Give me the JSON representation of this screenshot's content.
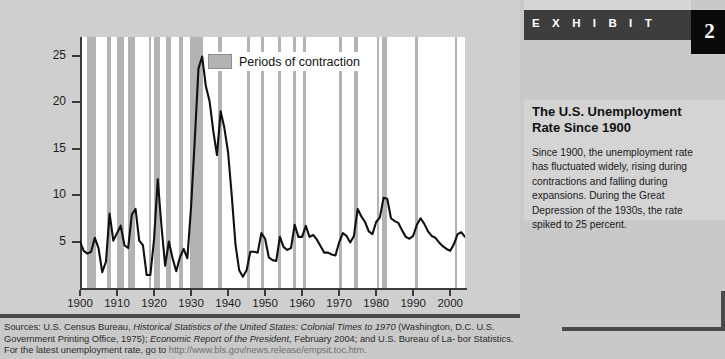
{
  "exhibit": {
    "header_label": "E X H I B I T",
    "number": "2",
    "title": "The U.S. Unemployment Rate Since 1900",
    "body": "Since 1900, the unemployment rate has fluctuated widely, rising during contractions and falling during expansions. During the Great Depression of the 1930s, the rate spiked to 25 percent.",
    "colors": {
      "header_bar": "#3d3d3d",
      "number_box": "#0a0a0a",
      "panel_bg": "#c9c9c9",
      "body_bg": "#d4d4d4",
      "edge_rule": "#4a4a4a"
    }
  },
  "sources": {
    "line1_prefix": "Sources: U.S. Census Bureau, ",
    "line1_italic": "Historical Statistics of the United States: Colonial Times to 1970",
    "line1_suffix": " (Washington, D.C.",
    "line2_prefix": "U.S. Government Printing Office, 1975); ",
    "line2_italic": "Economic Report of the President",
    "line2_suffix": ", February 2004; and U.S. Bureau of La-",
    "line3_prefix": "bor Statistics. For the latest unemployment rate, go to ",
    "line3_url": "http://www.bls.gov/news.release/empsit.toc.htm."
  },
  "chart_data": {
    "type": "line",
    "title": "The U.S. Unemployment Rate Since 1900",
    "xlabel": "",
    "ylabel": "",
    "xlim": [
      1900,
      2004
    ],
    "ylim": [
      0,
      27
    ],
    "grid": false,
    "legend_position": "top-center",
    "legend": [
      {
        "label": "Periods of contraction",
        "color": "#b3b3b3",
        "type": "band"
      }
    ],
    "ytick_labels": [
      "5",
      "10",
      "15",
      "20",
      "25"
    ],
    "ytick_values": [
      5,
      10,
      15,
      20,
      25
    ],
    "xtick_labels": [
      "1900",
      "1910",
      "1920",
      "1930",
      "1940",
      "1950",
      "1960",
      "1970",
      "1980",
      "1990",
      "2000"
    ],
    "xtick_values": [
      1900,
      1910,
      1920,
      1930,
      1940,
      1950,
      1960,
      1970,
      1980,
      1990,
      2000
    ],
    "series": [
      {
        "name": "U.S. unemployment rate (percent)",
        "color": "#111111",
        "x": [
          1900,
          1901,
          1902,
          1903,
          1904,
          1905,
          1906,
          1907,
          1908,
          1909,
          1910,
          1911,
          1912,
          1913,
          1914,
          1915,
          1916,
          1917,
          1918,
          1919,
          1920,
          1921,
          1922,
          1923,
          1924,
          1925,
          1926,
          1927,
          1928,
          1929,
          1930,
          1931,
          1932,
          1933,
          1934,
          1935,
          1936,
          1937,
          1938,
          1939,
          1940,
          1941,
          1942,
          1943,
          1944,
          1945,
          1946,
          1947,
          1948,
          1949,
          1950,
          1951,
          1952,
          1953,
          1954,
          1955,
          1956,
          1957,
          1958,
          1959,
          1960,
          1961,
          1962,
          1963,
          1964,
          1965,
          1966,
          1967,
          1968,
          1969,
          1970,
          1971,
          1972,
          1973,
          1974,
          1975,
          1976,
          1977,
          1978,
          1979,
          1980,
          1981,
          1982,
          1983,
          1984,
          1985,
          1986,
          1987,
          1988,
          1989,
          1990,
          1991,
          1992,
          1993,
          1994,
          1995,
          1996,
          1997,
          1998,
          1999,
          2000,
          2001,
          2002,
          2003,
          2004
        ],
        "values": [
          5.0,
          4.0,
          3.7,
          3.9,
          5.4,
          4.3,
          1.7,
          2.8,
          8.0,
          5.1,
          5.9,
          6.7,
          4.6,
          4.3,
          7.9,
          8.5,
          5.1,
          4.6,
          1.4,
          1.4,
          5.2,
          11.7,
          6.7,
          2.4,
          5.0,
          3.2,
          1.8,
          3.3,
          4.2,
          3.2,
          8.7,
          15.9,
          23.6,
          24.9,
          21.7,
          20.1,
          16.9,
          14.3,
          19.0,
          17.2,
          14.6,
          9.9,
          4.7,
          1.9,
          1.2,
          1.9,
          3.9,
          3.9,
          3.8,
          5.9,
          5.3,
          3.3,
          3.0,
          2.9,
          5.5,
          4.4,
          4.1,
          4.3,
          6.8,
          5.5,
          5.5,
          6.7,
          5.5,
          5.7,
          5.2,
          4.5,
          3.8,
          3.8,
          3.6,
          3.5,
          4.9,
          5.9,
          5.6,
          4.9,
          5.6,
          8.5,
          7.7,
          7.1,
          6.1,
          5.8,
          7.1,
          7.6,
          9.7,
          9.6,
          7.5,
          7.2,
          7.0,
          6.2,
          5.5,
          5.3,
          5.6,
          6.8,
          7.5,
          6.9,
          6.1,
          5.6,
          5.4,
          4.9,
          4.5,
          4.2,
          4.0,
          4.7,
          5.8,
          6.0,
          5.5
        ]
      }
    ],
    "contraction_bands": [
      {
        "start": 1902.0,
        "end": 1904.3
      },
      {
        "start": 1907.3,
        "end": 1908.5
      },
      {
        "start": 1910.1,
        "end": 1912.0
      },
      {
        "start": 1913.1,
        "end": 1914.9
      },
      {
        "start": 1918.6,
        "end": 1919.2
      },
      {
        "start": 1920.1,
        "end": 1921.5
      },
      {
        "start": 1923.3,
        "end": 1924.5
      },
      {
        "start": 1926.7,
        "end": 1927.8
      },
      {
        "start": 1929.6,
        "end": 1933.2
      },
      {
        "start": 1937.4,
        "end": 1938.4
      },
      {
        "start": 1945.1,
        "end": 1945.8
      },
      {
        "start": 1948.8,
        "end": 1949.8
      },
      {
        "start": 1953.5,
        "end": 1954.4
      },
      {
        "start": 1957.6,
        "end": 1958.3
      },
      {
        "start": 1960.3,
        "end": 1961.1
      },
      {
        "start": 1969.9,
        "end": 1970.9
      },
      {
        "start": 1973.9,
        "end": 1975.2
      },
      {
        "start": 1980.1,
        "end": 1980.5
      },
      {
        "start": 1981.5,
        "end": 1982.9
      },
      {
        "start": 1990.5,
        "end": 1991.2
      },
      {
        "start": 2001.2,
        "end": 2001.9
      }
    ]
  }
}
